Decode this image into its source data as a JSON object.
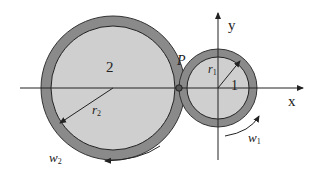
{
  "diagram": {
    "title": "",
    "colors": {
      "ring": "#8a8a8a",
      "fill": "#cfcfcf",
      "line": "#222222",
      "background": "#ffffff"
    },
    "gear2": {
      "label": "2",
      "radius_label": "r",
      "radius_sub": "2",
      "omega_label": "w",
      "omega_sub": "2"
    },
    "gear1": {
      "label": "1",
      "radius_label": "r",
      "radius_sub": "1",
      "omega_label": "w",
      "omega_sub": "1"
    },
    "contact_point": {
      "label": "P"
    },
    "axes": {
      "x_label": "x",
      "y_label": "y"
    }
  }
}
